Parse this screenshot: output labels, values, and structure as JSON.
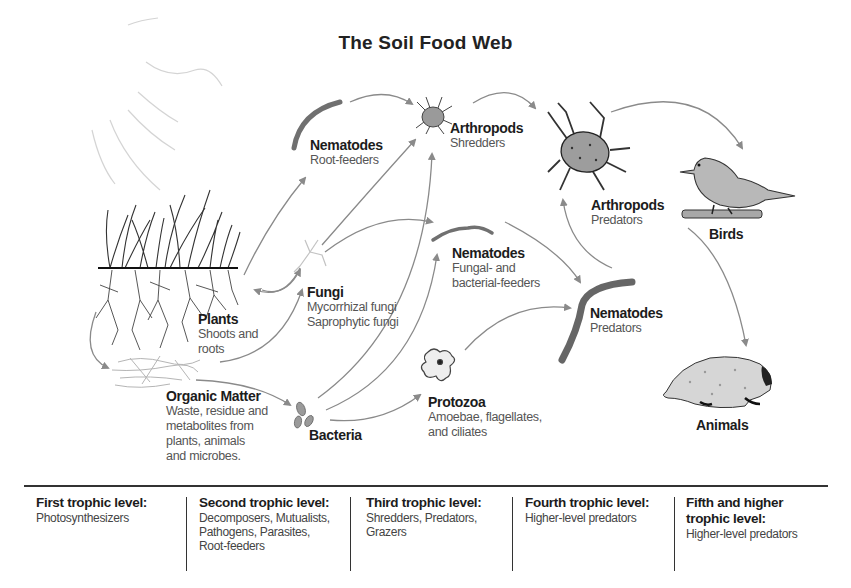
{
  "title": "The Soil Food Web",
  "nodes": {
    "plants": {
      "name": "Plants",
      "desc": [
        "Shoots and",
        "roots"
      ]
    },
    "organic_matter": {
      "name": "Organic Matter",
      "desc": [
        "Waste, residue and",
        "metabolites from",
        "plants, animals",
        "and microbes."
      ]
    },
    "nematodes_root": {
      "name": "Nematodes",
      "desc": [
        "Root-feeders"
      ]
    },
    "fungi": {
      "name": "Fungi",
      "desc": [
        "Mycorrhizal fungi",
        "Saprophytic fungi"
      ]
    },
    "bacteria": {
      "name": "Bacteria",
      "desc": []
    },
    "arthropods_shredders": {
      "name": "Arthropods",
      "desc": [
        "Shredders"
      ]
    },
    "nematodes_feeders": {
      "name": "Nematodes",
      "desc": [
        "Fungal- and",
        "bacterial-feeders"
      ]
    },
    "protozoa": {
      "name": "Protozoa",
      "desc": [
        "Amoebae, flagellates,",
        "and ciliates"
      ]
    },
    "arthropods_predators": {
      "name": "Arthropods",
      "desc": [
        "Predators"
      ]
    },
    "nematodes_predators": {
      "name": "Nematodes",
      "desc": [
        "Predators"
      ]
    },
    "birds": {
      "name": "Birds",
      "desc": []
    },
    "animals": {
      "name": "Animals",
      "desc": []
    }
  },
  "icons": {
    "plants": "grass-with-roots-icon",
    "organic_matter": "leaf-litter-icon",
    "nematode": "worm-icon",
    "fungi": "fungal-hyphae-icon",
    "bacteria": "bacteria-cells-icon",
    "arthropod": "mite-icon",
    "protozoa": "amoeba-icon",
    "bird": "bird-on-branch-icon",
    "animal": "mole-icon"
  },
  "trophic_levels": [
    {
      "title": [
        "First trophic level:"
      ],
      "desc": [
        "Photosynthesizers"
      ]
    },
    {
      "title": [
        "Second trophic level:"
      ],
      "desc": [
        "Decomposers, Mutualists,",
        "Pathogens, Parasites,",
        "Root-feeders"
      ]
    },
    {
      "title": [
        "Third trophic level:"
      ],
      "desc": [
        "Shredders, Predators,",
        "Grazers"
      ]
    },
    {
      "title": [
        "Fourth trophic level:"
      ],
      "desc": [
        "Higher-level predators"
      ]
    },
    {
      "title": [
        "Fifth and higher",
        "trophic level:"
      ],
      "desc": [
        "Higher-level predators"
      ]
    }
  ],
  "colors": {
    "arrow": "#8a8a8a",
    "text": "#1c1c1c",
    "subtext": "#555555",
    "nematode": "#6f6f6f",
    "creature_fill": "#a9a9a9"
  }
}
